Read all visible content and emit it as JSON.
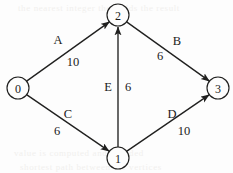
{
  "diagram": {
    "type": "directed-weighted-graph",
    "background_color": "#fdfdfd",
    "ink_color": "#20201f",
    "nodes": [
      {
        "id": "0",
        "label": "0",
        "cx": 18,
        "cy": 88,
        "r": 11
      },
      {
        "id": "1",
        "label": "1",
        "cx": 118,
        "cy": 158,
        "r": 11
      },
      {
        "id": "2",
        "label": "2",
        "cx": 118,
        "cy": 15,
        "r": 11
      },
      {
        "id": "3",
        "label": "3",
        "cx": 218,
        "cy": 88,
        "r": 11
      }
    ],
    "edges": [
      {
        "name": "A",
        "from": "0",
        "to": "2",
        "weight": "10",
        "name_x": 58,
        "name_y": 40,
        "weight_x": 73,
        "weight_y": 62
      },
      {
        "name": "B",
        "from": "2",
        "to": "3",
        "weight": "6",
        "name_x": 177,
        "name_y": 41,
        "weight_x": 160,
        "weight_y": 56
      },
      {
        "name": "C",
        "from": "0",
        "to": "1",
        "weight": "6",
        "name_x": 68,
        "name_y": 114,
        "weight_x": 57,
        "weight_y": 131
      },
      {
        "name": "D",
        "from": "1",
        "to": "3",
        "weight": "10",
        "name_x": 172,
        "name_y": 114,
        "weight_x": 184,
        "weight_y": 131
      },
      {
        "name": "E",
        "from": "1",
        "to": "2",
        "weight": "6",
        "name_x": 108,
        "name_y": 87,
        "weight_x": 128,
        "weight_y": 87
      }
    ],
    "bleed_through": [
      {
        "text": "the nearest integer then adds the result",
        "x": 18,
        "y": 3
      },
      {
        "text": "value is computed and rounded",
        "x": 14,
        "y": 148
      },
      {
        "text": "shortest path between the vertices",
        "x": 20,
        "y": 162
      }
    ]
  }
}
